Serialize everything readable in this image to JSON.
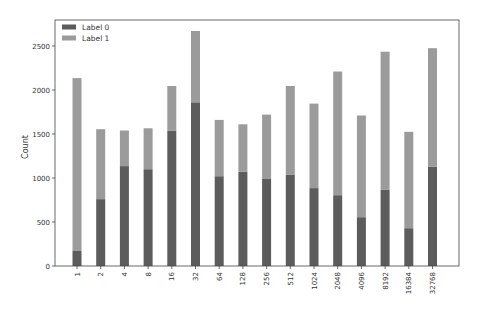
{
  "chart_data": {
    "type": "bar",
    "stacked": true,
    "title": "",
    "xlabel": "",
    "ylabel": "Count",
    "ylim": [
      0,
      2800
    ],
    "yticks": [
      0,
      500,
      1000,
      1500,
      2000,
      2500
    ],
    "grid": false,
    "legend_position": "upper left",
    "categories": [
      "1",
      "2",
      "4",
      "8",
      "16",
      "32",
      "64",
      "128",
      "256",
      "512",
      "1024",
      "2048",
      "4096",
      "8192",
      "16384",
      "32768"
    ],
    "series": [
      {
        "name": "Label 0",
        "color": "#5c5c5c",
        "values": [
          170,
          760,
          1135,
          1100,
          1540,
          1860,
          1020,
          1070,
          995,
          1035,
          885,
          805,
          555,
          865,
          430,
          1130
        ]
      },
      {
        "name": "Label 1",
        "color": "#9b9b9b",
        "values": [
          1965,
          795,
          405,
          465,
          505,
          810,
          640,
          540,
          725,
          1010,
          960,
          1405,
          1155,
          1570,
          1095,
          1345
        ]
      }
    ],
    "totals": [
      2135,
      1555,
      1540,
      1565,
      2045,
      2670,
      1660,
      1610,
      1720,
      2045,
      1845,
      2210,
      1710,
      2435,
      1525,
      2475
    ]
  }
}
